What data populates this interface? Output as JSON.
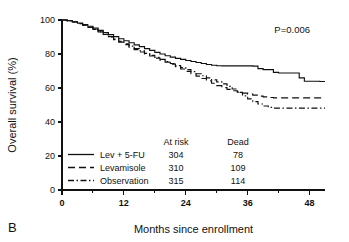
{
  "panel": {
    "letter": "B"
  },
  "annotations": {
    "pvalue": "P=0.006"
  },
  "legend": {
    "columns": [
      "At risk",
      "Dead"
    ],
    "entries": [
      {
        "label": "Lev + 5-FU",
        "style": "solid",
        "at_risk": "304",
        "dead": "78"
      },
      {
        "label": "Levamisole",
        "style": "dashed",
        "at_risk": "310",
        "dead": "109"
      },
      {
        "label": "Observation",
        "style": "dashdot",
        "at_risk": "315",
        "dead": "114"
      }
    ]
  },
  "chart_data": {
    "type": "line",
    "title": "",
    "subtitle": "",
    "xlabel": "Months since enrollment",
    "ylabel": "Overall survival (%)",
    "xlim": [
      0,
      51
    ],
    "ylim": [
      0,
      100
    ],
    "xticks": [
      0,
      12,
      24,
      36,
      48
    ],
    "xtick_labels": [
      "0",
      "12",
      "24",
      "36",
      "48"
    ],
    "x_minor_ticks": [
      6,
      18,
      30,
      42
    ],
    "yticks": [
      0,
      20,
      40,
      60,
      80,
      100
    ],
    "ytick_labels": [
      "0",
      "20",
      "40",
      "60",
      "80",
      "100"
    ],
    "grid": false,
    "legend_position": "lower-left-inside",
    "series": [
      {
        "name": "Lev + 5-FU",
        "style": "solid",
        "points": [
          [
            0,
            100
          ],
          [
            1,
            99.6
          ],
          [
            2,
            99.0
          ],
          [
            3,
            98.2
          ],
          [
            4,
            97.3
          ],
          [
            5,
            96.3
          ],
          [
            6,
            95.2
          ],
          [
            7,
            93.9
          ],
          [
            8,
            92.6
          ],
          [
            9,
            91.4
          ],
          [
            10,
            90.2
          ],
          [
            11,
            89.0
          ],
          [
            12,
            87.8
          ],
          [
            13,
            86.6
          ],
          [
            14,
            85.4
          ],
          [
            15,
            84.3
          ],
          [
            16,
            83.2
          ],
          [
            17,
            82.1
          ],
          [
            18,
            81.0
          ],
          [
            19,
            80.0
          ],
          [
            20,
            79.0
          ],
          [
            21,
            78.2
          ],
          [
            22,
            77.4
          ],
          [
            23,
            76.8
          ],
          [
            24,
            76.2
          ],
          [
            25,
            75.6
          ],
          [
            26,
            75.0
          ],
          [
            27,
            74.4
          ],
          [
            28,
            73.8
          ],
          [
            29,
            73.4
          ],
          [
            30,
            73.1
          ],
          [
            31,
            73.0
          ],
          [
            32,
            73.0
          ],
          [
            33,
            73.0
          ],
          [
            34,
            73.0
          ],
          [
            35,
            73.0
          ],
          [
            36,
            73.0
          ],
          [
            37,
            72.9
          ],
          [
            38,
            71.4
          ],
          [
            39,
            70.8
          ],
          [
            40,
            70.8
          ],
          [
            41,
            69.2
          ],
          [
            42,
            68.8
          ],
          [
            43,
            68.8
          ],
          [
            44,
            68.8
          ],
          [
            45,
            68.8
          ],
          [
            46,
            66.0
          ],
          [
            47,
            64.0
          ],
          [
            48,
            64.0
          ],
          [
            49,
            64.0
          ],
          [
            50,
            63.8
          ],
          [
            51,
            63.8
          ]
        ]
      },
      {
        "name": "Levamisole",
        "style": "dashed",
        "points": [
          [
            0,
            100
          ],
          [
            1,
            99.5
          ],
          [
            2,
            98.8
          ],
          [
            3,
            97.9
          ],
          [
            4,
            96.9
          ],
          [
            5,
            95.7
          ],
          [
            6,
            94.4
          ],
          [
            7,
            93.0
          ],
          [
            8,
            91.5
          ],
          [
            9,
            90.0
          ],
          [
            10,
            88.5
          ],
          [
            11,
            87.0
          ],
          [
            12,
            85.5
          ],
          [
            13,
            84.0
          ],
          [
            14,
            82.6
          ],
          [
            15,
            81.2
          ],
          [
            16,
            80.0
          ],
          [
            17,
            78.8
          ],
          [
            18,
            77.6
          ],
          [
            19,
            76.4
          ],
          [
            20,
            75.2
          ],
          [
            21,
            74.0
          ],
          [
            22,
            72.6
          ],
          [
            23,
            71.2
          ],
          [
            24,
            69.8
          ],
          [
            25,
            68.4
          ],
          [
            26,
            67.0
          ],
          [
            27,
            65.6
          ],
          [
            28,
            64.2
          ],
          [
            29,
            62.8
          ],
          [
            30,
            61.4
          ],
          [
            31,
            60.2
          ],
          [
            32,
            59.2
          ],
          [
            33,
            58.4
          ],
          [
            34,
            57.6
          ],
          [
            35,
            57.0
          ],
          [
            36,
            56.4
          ],
          [
            37,
            55.8
          ],
          [
            38,
            55.2
          ],
          [
            39,
            54.8
          ],
          [
            40,
            54.4
          ],
          [
            41,
            54.2
          ],
          [
            42,
            54.2
          ],
          [
            43,
            54.2
          ],
          [
            44,
            54.2
          ],
          [
            45,
            54.2
          ],
          [
            46,
            54.2
          ],
          [
            47,
            54.2
          ],
          [
            48,
            54.2
          ],
          [
            49,
            54.2
          ],
          [
            50,
            54.2
          ],
          [
            51,
            54.2
          ]
        ]
      },
      {
        "name": "Observation",
        "style": "dashdot",
        "points": [
          [
            0,
            100
          ],
          [
            1,
            99.5
          ],
          [
            2,
            98.8
          ],
          [
            3,
            97.9
          ],
          [
            4,
            96.9
          ],
          [
            5,
            95.7
          ],
          [
            6,
            94.4
          ],
          [
            7,
            93.0
          ],
          [
            8,
            91.6
          ],
          [
            9,
            90.2
          ],
          [
            10,
            88.8
          ],
          [
            11,
            87.4
          ],
          [
            12,
            86.0
          ],
          [
            13,
            84.6
          ],
          [
            14,
            83.2
          ],
          [
            15,
            81.8
          ],
          [
            16,
            80.4
          ],
          [
            17,
            79.2
          ],
          [
            18,
            78.0
          ],
          [
            19,
            76.8
          ],
          [
            20,
            75.6
          ],
          [
            21,
            74.4
          ],
          [
            22,
            73.2
          ],
          [
            23,
            72.0
          ],
          [
            24,
            70.8
          ],
          [
            25,
            69.6
          ],
          [
            26,
            68.4
          ],
          [
            27,
            67.2
          ],
          [
            28,
            66.0
          ],
          [
            29,
            64.8
          ],
          [
            30,
            63.6
          ],
          [
            31,
            62.4
          ],
          [
            32,
            61.0
          ],
          [
            33,
            59.4
          ],
          [
            34,
            57.4
          ],
          [
            35,
            55.4
          ],
          [
            36,
            53.6
          ],
          [
            37,
            52.0
          ],
          [
            38,
            50.6
          ],
          [
            39,
            49.4
          ],
          [
            40,
            48.6
          ],
          [
            41,
            48.2
          ],
          [
            42,
            48.2
          ],
          [
            43,
            48.2
          ],
          [
            44,
            48.2
          ],
          [
            45,
            48.2
          ],
          [
            46,
            48.2
          ],
          [
            47,
            48.2
          ],
          [
            48,
            48.2
          ],
          [
            49,
            48.2
          ],
          [
            50,
            48.2
          ],
          [
            51,
            48.2
          ]
        ]
      }
    ]
  }
}
